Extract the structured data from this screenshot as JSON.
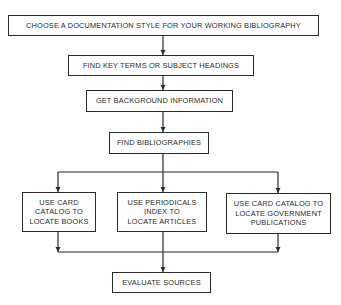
{
  "diagram": {
    "type": "flowchart",
    "nodes": [
      {
        "id": "choose-style",
        "label": "CHOOSE A DOCUMENTATION STYLE FOR YOUR WORKING BIBLIOGRAPHY"
      },
      {
        "id": "find-key-terms",
        "label": "FIND KEY TERMS OR SUBJECT HEADINGS"
      },
      {
        "id": "background-info",
        "label": "GET BACKGROUND INFORMATION"
      },
      {
        "id": "find-bibliographies",
        "label": "FIND BIBLIOGRAPHIES"
      },
      {
        "id": "card-catalog-books",
        "label": "USE CARD\nCATALOG TO\nLOCATE BOOKS"
      },
      {
        "id": "periodicals-index",
        "label": "USE PERIODICALS\nINDEX TO\nLOCATE ARTICLES"
      },
      {
        "id": "card-catalog-gov",
        "label": "USE CARD CATALOG TO\nLOCATE GOVERNMENT\nPUBLICATIONS"
      },
      {
        "id": "evaluate-sources",
        "label": "EVALUATE SOURCES"
      }
    ],
    "edges": [
      {
        "from": "choose-style",
        "to": "find-key-terms"
      },
      {
        "from": "find-key-terms",
        "to": "background-info"
      },
      {
        "from": "background-info",
        "to": "find-bibliographies"
      },
      {
        "from": "find-bibliographies",
        "to": "card-catalog-books"
      },
      {
        "from": "find-bibliographies",
        "to": "periodicals-index"
      },
      {
        "from": "find-bibliographies",
        "to": "card-catalog-gov"
      },
      {
        "from": "card-catalog-books",
        "to": "evaluate-sources"
      },
      {
        "from": "periodicals-index",
        "to": "evaluate-sources"
      },
      {
        "from": "card-catalog-gov",
        "to": "evaluate-sources"
      }
    ]
  }
}
